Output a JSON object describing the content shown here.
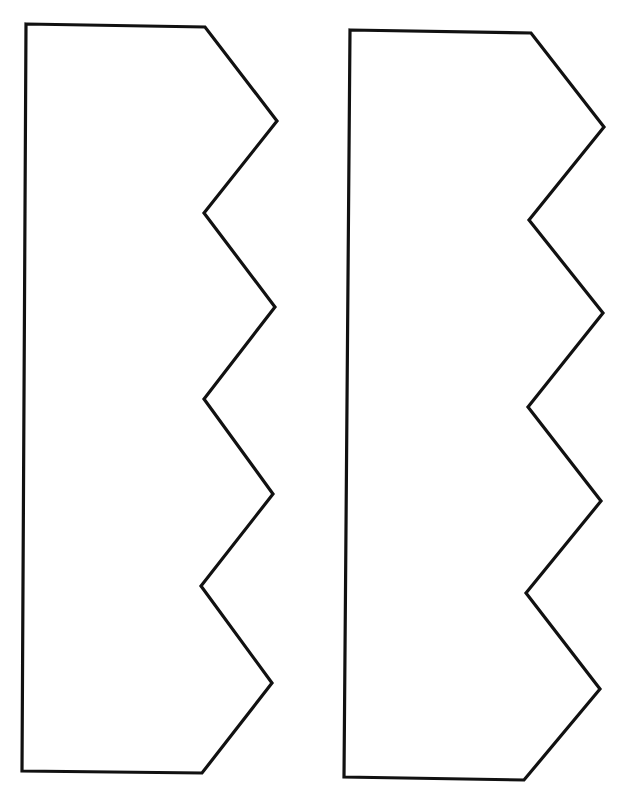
{
  "canvas": {
    "width": 636,
    "height": 797,
    "background": "#ffffff",
    "stroke_color": "#111111"
  },
  "shapes": [
    {
      "name": "left-zigzag-shape",
      "points": "26,24 205,27 277,121 204,213 275,307 204,399 273,494 201,586 272,683 202,773 22,771"
    },
    {
      "name": "right-zigzag-shape",
      "points": "350,30 531,33 604,127 529,220 603,313 528,407 601,501 526,593 600,689 524,780 344,777"
    }
  ]
}
